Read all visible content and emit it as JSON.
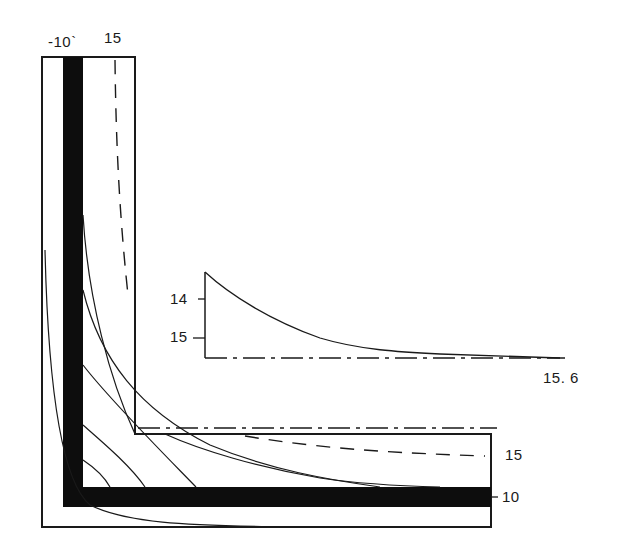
{
  "diagram": {
    "type": "L-shaped corner section with isotherm lines and inset temperature profile",
    "colors": {
      "ink": "#1a1a1a",
      "wall": "#0d0d0d",
      "background": "#ffffff"
    },
    "labels": {
      "top_left": "-10`",
      "top_right": "15",
      "right_upper": "15",
      "right_lower": "10",
      "inset_tick_upper": "14",
      "inset_tick_lower": "15",
      "inset_end_value": "15. 6"
    }
  }
}
